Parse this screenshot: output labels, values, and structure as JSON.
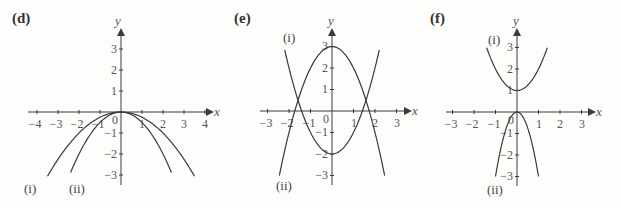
{
  "chart_data": [
    {
      "type": "line",
      "panel": "(d)",
      "xlabel": "x",
      "ylabel": "y",
      "xticks": [
        -4,
        -3,
        -2,
        -1,
        0,
        1,
        2,
        3,
        4
      ],
      "yticks": [
        -3,
        -2,
        -1,
        1,
        2,
        3
      ],
      "xlim": [
        -4.3,
        4.3
      ],
      "ylim": [
        -3.3,
        3.6
      ],
      "series": [
        {
          "name": "(i)",
          "equation": "y = -x^2/4",
          "x_range": [
            -3.5,
            3.5
          ]
        },
        {
          "name": "(ii)",
          "equation": "y = -x^2/2",
          "x_range": [
            -2.4,
            2.4
          ]
        }
      ]
    },
    {
      "type": "line",
      "panel": "(e)",
      "xlabel": "x",
      "ylabel": "y",
      "xticks": [
        -3,
        -2,
        -1,
        0,
        1,
        2,
        3
      ],
      "yticks": [
        -3,
        -2,
        -1,
        1,
        2,
        3
      ],
      "xlim": [
        -3.3,
        3.6
      ],
      "ylim": [
        -3.3,
        3.6
      ],
      "series": [
        {
          "name": "(i)",
          "equation": "y = x^2 - 2",
          "x_range": [
            -2.2,
            2.2
          ]
        },
        {
          "name": "(ii)",
          "equation": "y = 3 - x^2",
          "x_range": [
            -2.45,
            2.45
          ]
        }
      ]
    },
    {
      "type": "line",
      "panel": "(f)",
      "xlabel": "x",
      "ylabel": "y",
      "xticks": [
        -3,
        -2,
        -1,
        0,
        1,
        2,
        3
      ],
      "yticks": [
        -3,
        -2,
        -1,
        1,
        2,
        3
      ],
      "xlim": [
        -3.3,
        3.6
      ],
      "ylim": [
        -3.3,
        3.6
      ],
      "series": [
        {
          "name": "(i)",
          "equation": "y = x^2 + 1",
          "x_range": [
            -1.41,
            1.41
          ]
        },
        {
          "name": "(ii)",
          "equation": "y = -3x^2",
          "x_range": [
            -1,
            1
          ]
        }
      ]
    }
  ],
  "panels": {
    "d": {
      "label": "(d)",
      "curve_i": "(i)",
      "curve_ii": "(ii)",
      "xname": "x",
      "yname": "y"
    },
    "e": {
      "label": "(e)",
      "curve_i": "(i)",
      "curve_ii": "(ii)",
      "xname": "x",
      "yname": "y"
    },
    "f": {
      "label": "(f)",
      "curve_i": "(i)",
      "curve_ii": "(ii)",
      "xname": "x",
      "yname": "y"
    }
  },
  "ticks": {
    "n4": "−4",
    "n3": "−3",
    "n2": "−2",
    "n1": "−1",
    "z": "0",
    "p1": "1",
    "p2": "2",
    "p3": "3",
    "p4": "4"
  },
  "colors": {
    "ink": "#3a3a3a",
    "background": "#fdfdfb"
  }
}
